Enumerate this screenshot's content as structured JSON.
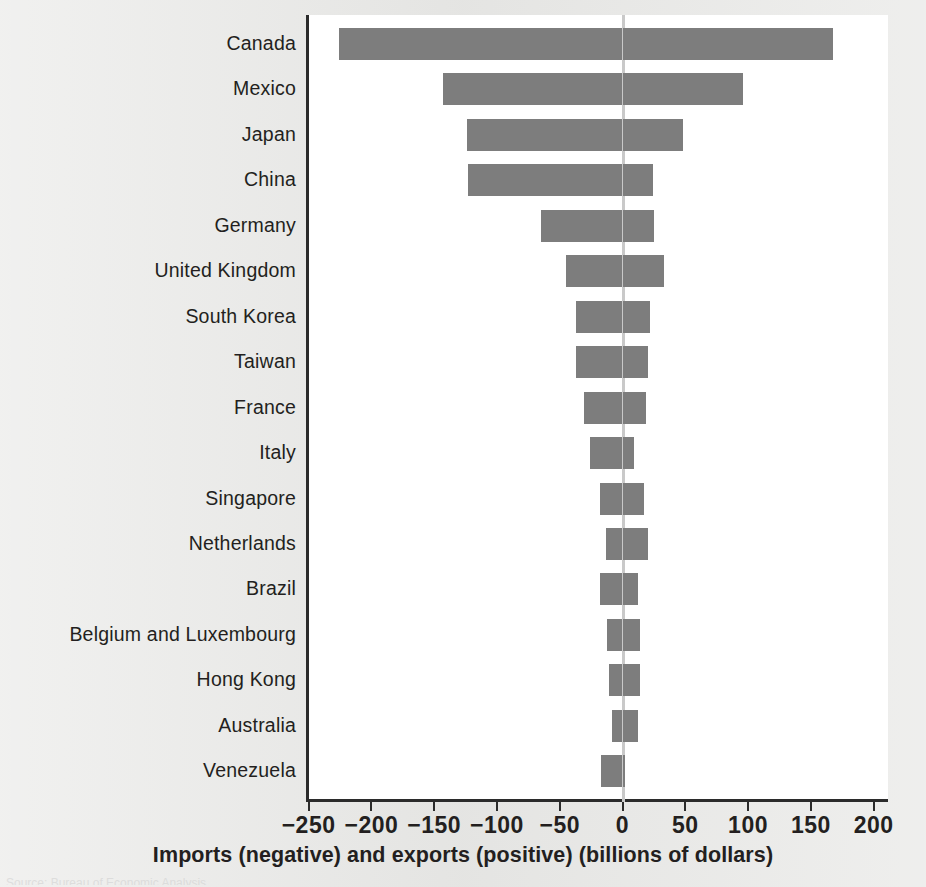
{
  "figure": {
    "x_axis_title": "Imports (negative) and exports (positive) (billions of dollars)",
    "source_note": "Source: Bureau of Economic Analysis",
    "bar_color": "#7d7d7d",
    "axis_color": "#2b2b2b",
    "zero_line_color": "#c9c9c9",
    "panel_background": "#ffffff",
    "page_background": "#e9e9e7"
  },
  "chart_data": {
    "type": "bar",
    "orientation": "horizontal",
    "title": "",
    "subtitle": "",
    "xlabel": "Imports (negative) and exports (positive) (billions of dollars)",
    "ylabel": "",
    "xlim": [
      -250,
      200
    ],
    "xticks": [
      -250,
      -200,
      -150,
      -100,
      -50,
      0,
      50,
      100,
      150,
      200
    ],
    "xtick_labels": [
      "−250",
      "−200",
      "−150",
      "−100",
      "−50",
      "0",
      "50",
      "100",
      "150",
      "200"
    ],
    "grid": false,
    "legend": null,
    "zero_reference_line": 0,
    "categories": [
      "Canada",
      "Mexico",
      "Japan",
      "China",
      "Germany",
      "United Kingdom",
      "South Korea",
      "Taiwan",
      "France",
      "Italy",
      "Singapore",
      "Netherlands",
      "Brazil",
      "Belgium and Luxembourg",
      "Hong Kong",
      "Australia",
      "Venezuela"
    ],
    "series": [
      {
        "name": "Imports (negative)",
        "values": [
          -226,
          -143,
          -124,
          -123,
          -65,
          -45,
          -37,
          -37,
          -31,
          -26,
          -18,
          -13,
          -18,
          -12,
          -11,
          -8,
          -17
        ]
      },
      {
        "name": "Exports (positive)",
        "values": [
          168,
          96,
          48,
          24,
          25,
          33,
          22,
          20,
          19,
          9,
          17,
          20,
          12,
          14,
          14,
          12,
          2
        ]
      }
    ]
  }
}
